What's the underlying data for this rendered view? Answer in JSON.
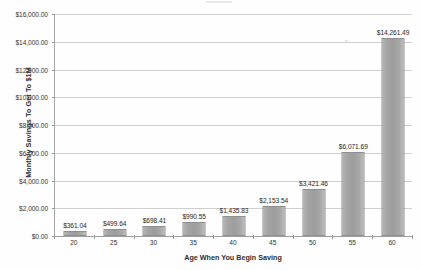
{
  "chart_data": {
    "type": "bar",
    "title": "",
    "xlabel": "Age When You Begin Saving",
    "ylabel": "Monthly Savings To Get To $1M",
    "categories": [
      "20",
      "25",
      "30",
      "35",
      "40",
      "45",
      "50",
      "55",
      "60"
    ],
    "values": [
      361.04,
      499.64,
      698.41,
      990.55,
      1435.83,
      2153.54,
      3421.46,
      6071.69,
      14261.49
    ],
    "data_labels": [
      "$361.04",
      "$499.64",
      "$698.41",
      "$990.55",
      "$1,435.83",
      "$2,153.54",
      "$3,421.46",
      "$6,071.69",
      "$14,261.49"
    ],
    "ylim": [
      0,
      16000
    ],
    "ytick_values": [
      0,
      2000,
      4000,
      6000,
      8000,
      10000,
      12000,
      14000,
      16000
    ],
    "ytick_labels": [
      "$0.00",
      "$2,000.00",
      "$4,000.00",
      "$6,000.00",
      "$8,000.00",
      "$10,000.00",
      "$12,000.00",
      "$14,000.00",
      "$16,000.00"
    ],
    "grid": true,
    "legend": false,
    "legend_position": "none",
    "series": [
      {
        "name": "Monthly Savings To Get To $1M",
        "values": [
          361.04,
          499.64,
          698.41,
          990.55,
          1435.83,
          2153.54,
          3421.46,
          6071.69,
          14261.49
        ]
      }
    ],
    "colors": {
      "bar_fill": "#a6a6a6",
      "bar_border": "#8f8f8f",
      "gridline": "#cfcfcf",
      "axis_line": "#a0a0a0",
      "text": "#2b2b2b",
      "background": "#ffffff"
    }
  }
}
